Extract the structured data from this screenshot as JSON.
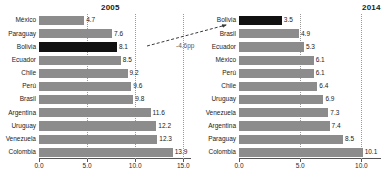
{
  "figure": {
    "panels": [
      {
        "name": "panel-2005",
        "title": "2005",
        "axis": {
          "ticks": [
            "0.0",
            "5.0",
            "10.0",
            "15.0"
          ],
          "tick_values": [
            0,
            5,
            10,
            15
          ],
          "min": 0,
          "max": 15.8
        },
        "categories": [
          "México",
          "Paraguay",
          "Bolivia",
          "Ecuador",
          "Chile",
          "Perú",
          "Brasil",
          "Argentina",
          "Uruguay",
          "Venezuela",
          "Colombia"
        ],
        "values": [
          4.7,
          7.6,
          8.1,
          8.5,
          9.2,
          9.6,
          9.8,
          11.6,
          12.2,
          12.3,
          13.9
        ],
        "value_labels": [
          "4.7",
          "7.6",
          "8.1",
          "8.5",
          "9.2",
          "9.6",
          "9.8",
          "11.6",
          "12.2",
          "12.3",
          "13.9"
        ],
        "highlight": "Bolivia"
      },
      {
        "name": "panel-2014",
        "title": "2014",
        "axis": {
          "ticks": [
            "0.0",
            "5.0",
            "10.0"
          ],
          "tick_values": [
            0,
            5,
            10
          ],
          "min": 0,
          "max": 11.6
        },
        "categories": [
          "Bolivia",
          "Brasil",
          "Ecuador",
          "México",
          "Perú",
          "Chile",
          "Uruguay",
          "Venezuela",
          "Argentina",
          "Paraguay",
          "Colombia"
        ],
        "values": [
          3.5,
          4.9,
          5.3,
          6.1,
          6.1,
          6.4,
          6.9,
          7.3,
          7.4,
          8.5,
          10.1
        ],
        "value_labels": [
          "3.5",
          "4.9",
          "5.3",
          "6.1",
          "6.1",
          "6.4",
          "6.9",
          "7.3",
          "7.4",
          "8.5",
          "10.1"
        ],
        "highlight": "Bolivia"
      }
    ],
    "annotation": {
      "label": "-4.6pp"
    },
    "colors": {
      "bar": "#8c8c8c",
      "highlight_bar": "#111111",
      "grid": "#9a9a9a",
      "axis": "#555555",
      "text": "#1a1a1a",
      "annotation_text": "#5a5a5a"
    }
  },
  "chart_data": {
    "type": "bar",
    "orientation": "horizontal",
    "title": "",
    "panels": [
      {
        "title": "2005",
        "categories": [
          "México",
          "Paraguay",
          "Bolivia",
          "Ecuador",
          "Chile",
          "Perú",
          "Brasil",
          "Argentina",
          "Uruguay",
          "Venezuela",
          "Colombia"
        ],
        "values": [
          4.7,
          7.6,
          8.1,
          8.5,
          9.2,
          9.6,
          9.8,
          11.6,
          12.2,
          12.3,
          13.9
        ],
        "xlabel": "",
        "ylabel": "",
        "xlim": [
          0,
          15.8
        ],
        "xticks": [
          0,
          5,
          10,
          15
        ],
        "xticklabels": [
          "0.0",
          "5.0",
          "10.0",
          "15.0"
        ],
        "highlighted_category": "Bolivia",
        "grid": true,
        "legend": false
      },
      {
        "title": "2014",
        "categories": [
          "Bolivia",
          "Brasil",
          "Ecuador",
          "México",
          "Perú",
          "Chile",
          "Uruguay",
          "Venezuela",
          "Argentina",
          "Paraguay",
          "Colombia"
        ],
        "values": [
          3.5,
          4.9,
          5.3,
          6.1,
          6.1,
          6.4,
          6.9,
          7.3,
          7.4,
          8.5,
          10.1
        ],
        "xlabel": "",
        "ylabel": "",
        "xlim": [
          0,
          11.6
        ],
        "xticks": [
          0,
          5,
          10
        ],
        "xticklabels": [
          "0.0",
          "5.0",
          "10.0"
        ],
        "highlighted_category": "Bolivia",
        "grid": true,
        "legend": false
      }
    ],
    "annotations": [
      {
        "text": "-4.6pp",
        "from": "Bolivia 2005 (8.1)",
        "to": "Bolivia 2014 (3.5)"
      }
    ]
  }
}
